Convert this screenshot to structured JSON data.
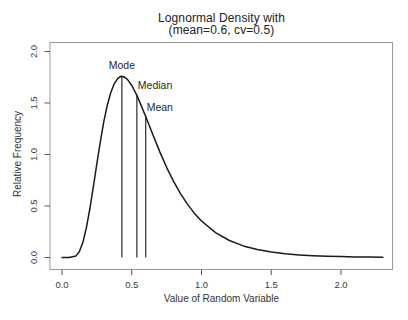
{
  "figure": {
    "title_line1": "Lognormal Density with",
    "title_line2": "(mean=0.6, cv=0.5)",
    "xlabel": "Value of Random Variable",
    "ylabel": "Relative Frequency"
  },
  "chart_data": {
    "type": "line",
    "title": "Lognormal Density with (mean=0.6, cv=0.5)",
    "xlabel": "Value of Random Variable",
    "ylabel": "Relative Frequency",
    "xlim": [
      0,
      2.3
    ],
    "ylim": [
      0,
      2.0
    ],
    "grid": false,
    "x_ticks": [
      0.0,
      0.5,
      1.0,
      1.5,
      2.0
    ],
    "x_tick_labels": [
      "0.0",
      "0.5",
      "1.0",
      "1.5",
      "2.0"
    ],
    "y_ticks": [
      0.0,
      0.5,
      1.0,
      1.5,
      2.0
    ],
    "y_tick_labels": [
      "0.0",
      "0.5",
      "1.0",
      "1.5",
      "2.0"
    ],
    "distribution": {
      "family": "lognormal",
      "mean": 0.6,
      "cv": 0.5,
      "meanlog": -0.6224,
      "sdlog": 0.4724
    },
    "curve": [
      [
        0.0,
        0.0
      ],
      [
        0.05,
        0.0001
      ],
      [
        0.1,
        0.0151
      ],
      [
        0.125,
        0.0581
      ],
      [
        0.15,
        0.1479
      ],
      [
        0.175,
        0.2896
      ],
      [
        0.2,
        0.4759
      ],
      [
        0.225,
        0.6903
      ],
      [
        0.25,
        0.9137
      ],
      [
        0.275,
        1.1279
      ],
      [
        0.3,
        1.3191
      ],
      [
        0.325,
        1.4791
      ],
      [
        0.35,
        1.6023
      ],
      [
        0.375,
        1.6888
      ],
      [
        0.4,
        1.7397
      ],
      [
        0.42,
        1.7576
      ],
      [
        0.4293,
        1.7594
      ],
      [
        0.45,
        1.7508
      ],
      [
        0.47,
        1.7274
      ],
      [
        0.5,
        1.6702
      ],
      [
        0.5367,
        1.5735
      ],
      [
        0.55,
        1.5334
      ],
      [
        0.6,
        1.3688
      ],
      [
        0.65,
        1.1966
      ],
      [
        0.7,
        1.03
      ],
      [
        0.75,
        0.876
      ],
      [
        0.8,
        0.7385
      ],
      [
        0.85,
        0.6186
      ],
      [
        0.9,
        0.5155
      ],
      [
        0.95,
        0.428
      ],
      [
        1.0,
        0.3545
      ],
      [
        1.1,
        0.2421
      ],
      [
        1.2,
        0.1649
      ],
      [
        1.3,
        0.1124
      ],
      [
        1.4,
        0.0768
      ],
      [
        1.5,
        0.0527
      ],
      [
        1.6,
        0.0364
      ],
      [
        1.7,
        0.0252
      ],
      [
        1.8,
        0.0176
      ],
      [
        1.9,
        0.0124
      ],
      [
        2.0,
        0.0087
      ],
      [
        2.1,
        0.0062
      ],
      [
        2.2,
        0.0044
      ],
      [
        2.3,
        0.0032
      ]
    ],
    "annotations": [
      {
        "label": "Mode",
        "x": 0.4293,
        "y": 1.7594
      },
      {
        "label": "Median",
        "x": 0.5367,
        "y": 1.5735
      },
      {
        "label": "Mean",
        "x": 0.6,
        "y": 1.3688
      }
    ],
    "colors": {
      "background": "#ffffff",
      "frame": "#9a9a9a",
      "tick": "#555555",
      "curve": "#1a1a1a",
      "stat_line": "#2b2b2b",
      "text": "#2b2b2b"
    }
  }
}
